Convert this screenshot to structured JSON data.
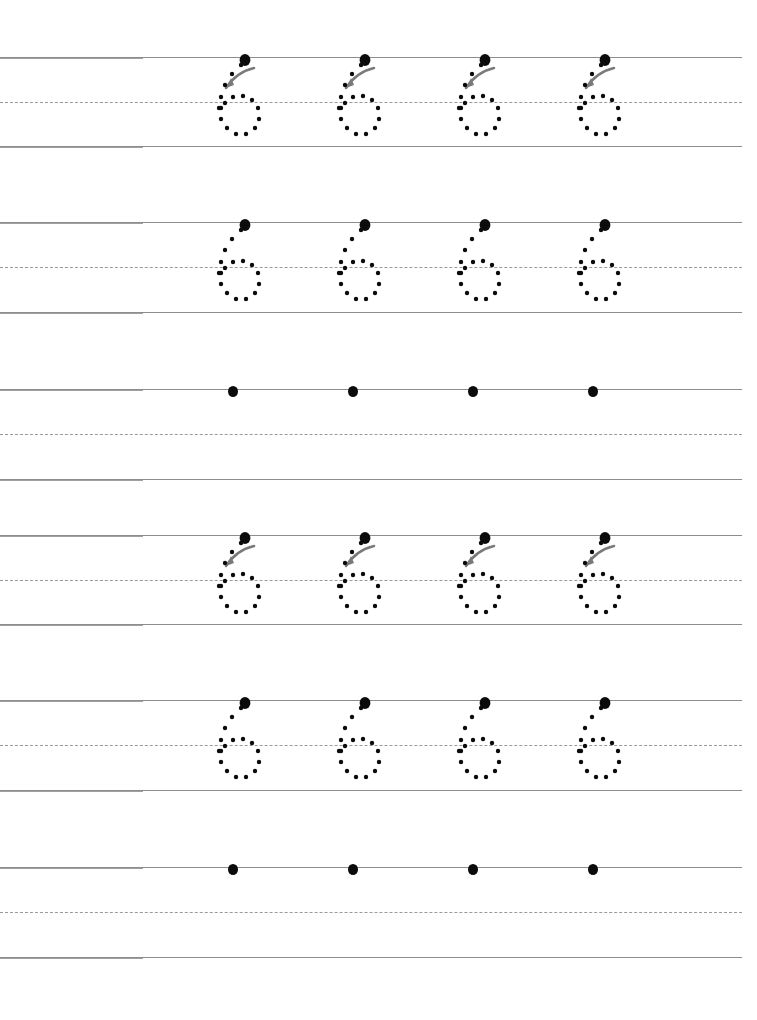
{
  "worksheet": {
    "title": "Number 6 Tracing Practice Worksheet",
    "digit": "6",
    "page_width": 757,
    "page_height": 1020,
    "background_color": "#ffffff",
    "rule_color": "#8d8d8d",
    "dashed_rule_color": "#9a9a9a",
    "dot_color": "#0b0b0b",
    "arrow_color": "#7a7a7a",
    "columns_per_row": 4,
    "column_x_centers": [
      233,
      353,
      473,
      593
    ],
    "line_left_x": 0,
    "line_right_x": 742
  },
  "rows": [
    {
      "index": 1,
      "name": "traced-row-with-arrows",
      "kind": "trace_with_arrow",
      "digit": "6",
      "count": 4,
      "has_arrow": true,
      "has_dotted_digit": true,
      "has_start_dot": true,
      "top_y": 57,
      "mid_y": 102,
      "base_y": 146
    },
    {
      "index": 2,
      "name": "traced-row-no-arrows",
      "kind": "trace_plain",
      "digit": "6",
      "count": 4,
      "has_arrow": false,
      "has_dotted_digit": true,
      "has_start_dot": true,
      "top_y": 222,
      "mid_y": 267,
      "base_y": 312
    },
    {
      "index": 3,
      "name": "free-practice-row",
      "kind": "free_practice",
      "digit": "6",
      "count": 4,
      "has_arrow": false,
      "has_dotted_digit": false,
      "has_start_dot": true,
      "top_y": 389,
      "mid_y": 434,
      "base_y": 479
    },
    {
      "index": 4,
      "name": "traced-row-with-arrows",
      "kind": "trace_with_arrow",
      "digit": "6",
      "count": 4,
      "has_arrow": true,
      "has_dotted_digit": true,
      "has_start_dot": true,
      "top_y": 535,
      "mid_y": 580,
      "base_y": 624
    },
    {
      "index": 5,
      "name": "traced-row-no-arrows",
      "kind": "trace_plain",
      "digit": "6",
      "count": 4,
      "has_arrow": false,
      "has_dotted_digit": true,
      "has_start_dot": true,
      "top_y": 700,
      "mid_y": 745,
      "base_y": 790
    },
    {
      "index": 6,
      "name": "free-practice-row",
      "kind": "free_practice",
      "digit": "6",
      "count": 4,
      "has_arrow": false,
      "has_dotted_digit": false,
      "has_start_dot": true,
      "top_y": 867,
      "mid_y": 912,
      "base_y": 957
    }
  ],
  "glyph": {
    "name": "digit-six-dotted",
    "description": "Dotted outline of the numeral 6: a curved diagonal descending stroke from upper right to lower left, joining a closed oval bowl in the lower half.",
    "dots": [
      [
        40,
        2
      ],
      [
        31,
        11
      ],
      [
        24,
        22
      ],
      [
        20,
        34
      ],
      [
        18,
        45
      ],
      [
        20,
        56
      ],
      [
        26,
        65
      ],
      [
        35,
        71
      ],
      [
        45,
        71
      ],
      [
        54,
        65
      ],
      [
        58,
        56
      ],
      [
        57,
        45
      ],
      [
        51,
        37
      ],
      [
        42,
        33
      ],
      [
        32,
        34
      ],
      [
        24,
        40
      ],
      [
        20,
        45
      ]
    ],
    "dot_radius": 2.2,
    "start_dot": [
      44,
      -3
    ],
    "arrow": {
      "name": "stroke-direction-arrow",
      "path": "M 53 5 C 44 7, 33 13, 25 25",
      "head": [
        [
          25,
          25
        ],
        [
          33,
          22
        ],
        [
          30,
          15
        ]
      ]
    }
  }
}
